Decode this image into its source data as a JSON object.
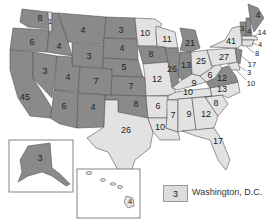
{
  "map": {
    "title": "Electoral votes by state",
    "colors": {
      "party_a": "#8a8a8a",
      "party_b": "#e2e2e2",
      "border": "#555555"
    },
    "states": [
      {
        "id": "WA",
        "votes": "8",
        "shade": "dark"
      },
      {
        "id": "ID-strip",
        "votes": "1",
        "shade": "light"
      },
      {
        "id": "OR",
        "votes": "6",
        "shade": "dark"
      },
      {
        "id": "CA",
        "votes": "45",
        "shade": "dark"
      },
      {
        "id": "NV",
        "votes": "3",
        "shade": "dark"
      },
      {
        "id": "ID",
        "votes": "4",
        "shade": "dark"
      },
      {
        "id": "MT",
        "votes": "4",
        "shade": "dark"
      },
      {
        "id": "WY",
        "votes": "3",
        "shade": "dark"
      },
      {
        "id": "UT",
        "votes": "4",
        "shade": "dark"
      },
      {
        "id": "AZ",
        "votes": "6",
        "shade": "dark"
      },
      {
        "id": "CO",
        "votes": "7",
        "shade": "dark"
      },
      {
        "id": "NM",
        "votes": "4",
        "shade": "dark"
      },
      {
        "id": "ND",
        "votes": "3",
        "shade": "dark"
      },
      {
        "id": "SD",
        "votes": "4",
        "shade": "dark"
      },
      {
        "id": "NE",
        "votes": "5",
        "shade": "dark"
      },
      {
        "id": "KS",
        "votes": "7",
        "shade": "dark"
      },
      {
        "id": "OK",
        "votes": "8",
        "shade": "dark"
      },
      {
        "id": "TX",
        "votes": "26",
        "shade": "light"
      },
      {
        "id": "MN",
        "votes": "10",
        "shade": "light"
      },
      {
        "id": "IA",
        "votes": "8",
        "shade": "dark"
      },
      {
        "id": "MO",
        "votes": "12",
        "shade": "light"
      },
      {
        "id": "AR",
        "votes": "6",
        "shade": "light"
      },
      {
        "id": "LA",
        "votes": "10",
        "shade": "light"
      },
      {
        "id": "WI",
        "votes": "11",
        "shade": "light"
      },
      {
        "id": "IL",
        "votes": "26",
        "shade": "dark"
      },
      {
        "id": "MI",
        "votes": "21",
        "shade": "dark"
      },
      {
        "id": "IN",
        "votes": "13",
        "shade": "dark"
      },
      {
        "id": "OH",
        "votes": "25",
        "shade": "light"
      },
      {
        "id": "KY",
        "votes": "9",
        "shade": "light"
      },
      {
        "id": "TN",
        "votes": "10",
        "shade": "light"
      },
      {
        "id": "MS",
        "votes": "7",
        "shade": "light"
      },
      {
        "id": "AL",
        "votes": "9",
        "shade": "light"
      },
      {
        "id": "GA",
        "votes": "12",
        "shade": "light"
      },
      {
        "id": "FL",
        "votes": "17",
        "shade": "light"
      },
      {
        "id": "SC",
        "votes": "8",
        "shade": "light"
      },
      {
        "id": "NC",
        "votes": "13",
        "shade": "light"
      },
      {
        "id": "VA",
        "votes": "12",
        "shade": "dark"
      },
      {
        "id": "WV",
        "votes": "6",
        "shade": "light"
      },
      {
        "id": "PA",
        "votes": "27",
        "shade": "light"
      },
      {
        "id": "NY",
        "votes": "41",
        "shade": "light"
      },
      {
        "id": "VT",
        "votes": "3",
        "shade": "dark"
      },
      {
        "id": "NH",
        "votes": "4",
        "shade": "dark"
      },
      {
        "id": "ME",
        "votes": "4",
        "shade": "dark"
      },
      {
        "id": "MA",
        "votes": "14",
        "shade": "light"
      },
      {
        "id": "RI",
        "votes": "4",
        "shade": "light"
      },
      {
        "id": "CT",
        "votes": "8",
        "shade": "light"
      },
      {
        "id": "NJ",
        "votes": "17",
        "shade": "dark"
      },
      {
        "id": "DE",
        "votes": "3",
        "shade": "light"
      },
      {
        "id": "MD",
        "votes": "10",
        "shade": "light"
      },
      {
        "id": "AK",
        "votes": "3",
        "shade": "dark"
      },
      {
        "id": "HI",
        "votes": "4",
        "shade": "light"
      }
    ],
    "legend": {
      "votes": "3",
      "label": "Washington, D.C."
    }
  }
}
